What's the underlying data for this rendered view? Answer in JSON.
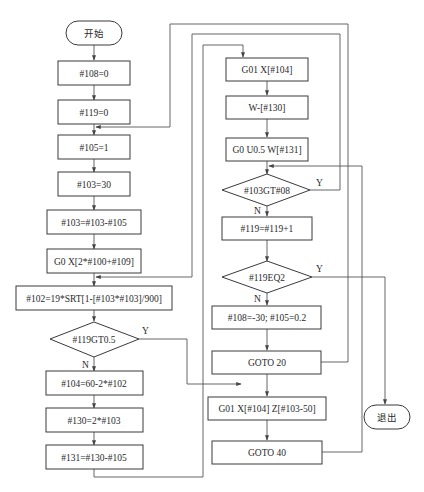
{
  "diagram": {
    "type": "flowchart",
    "title": "",
    "nodes": [
      {
        "id": "start",
        "shape": "terminal",
        "label": "开始"
      },
      {
        "id": "n1",
        "shape": "process",
        "label": "#108=0"
      },
      {
        "id": "n2",
        "shape": "process",
        "label": "#119=0"
      },
      {
        "id": "n3",
        "shape": "process",
        "label": "#105=1"
      },
      {
        "id": "n4",
        "shape": "process",
        "label": "#103=30"
      },
      {
        "id": "n5",
        "shape": "process",
        "label": "#103=#103-#105"
      },
      {
        "id": "n6",
        "shape": "process",
        "label": "G0 X[2*#100+#109]"
      },
      {
        "id": "n7",
        "shape": "process",
        "label": "#102=19*SRT[1-[#103*#103]/900]"
      },
      {
        "id": "d1",
        "shape": "decision",
        "label": "#119GT0.5"
      },
      {
        "id": "n8",
        "shape": "process",
        "label": "#104=60-2*#102"
      },
      {
        "id": "n9",
        "shape": "process",
        "label": "#130=2*#103"
      },
      {
        "id": "n10",
        "shape": "process",
        "label": "#131=#130-#105"
      },
      {
        "id": "r1",
        "shape": "process",
        "label": "G01 X[#104]"
      },
      {
        "id": "r2",
        "shape": "process",
        "label": "W-[#130]"
      },
      {
        "id": "r3",
        "shape": "process",
        "label": "G0 U0.5 W[#131]"
      },
      {
        "id": "d2",
        "shape": "decision",
        "label": "#103GT#08"
      },
      {
        "id": "r4",
        "shape": "process",
        "label": "#119=#119+1"
      },
      {
        "id": "d3",
        "shape": "decision",
        "label": "#119EQ2"
      },
      {
        "id": "r5",
        "shape": "process",
        "label": "#108=-30; #105=0.2"
      },
      {
        "id": "r6",
        "shape": "process",
        "label": "GOTO 20"
      },
      {
        "id": "r7",
        "shape": "process",
        "label": "G01 X[#104] Z[#103-50]"
      },
      {
        "id": "r8",
        "shape": "process",
        "label": "GOTO 40"
      },
      {
        "id": "exit",
        "shape": "terminal",
        "label": "退出"
      }
    ],
    "edges": [
      {
        "from": "start",
        "to": "n1",
        "label": ""
      },
      {
        "from": "n1",
        "to": "n2",
        "label": ""
      },
      {
        "from": "n2",
        "to": "n3",
        "label": ""
      },
      {
        "from": "n3",
        "to": "n4",
        "label": ""
      },
      {
        "from": "n4",
        "to": "n5",
        "label": ""
      },
      {
        "from": "n5",
        "to": "n6",
        "label": ""
      },
      {
        "from": "n6",
        "to": "n7",
        "label": ""
      },
      {
        "from": "n7",
        "to": "d1",
        "label": ""
      },
      {
        "from": "d1",
        "to": "n8",
        "label": "N"
      },
      {
        "from": "d1",
        "to": "r7",
        "label": "Y"
      },
      {
        "from": "n8",
        "to": "n9",
        "label": ""
      },
      {
        "from": "n9",
        "to": "n10",
        "label": ""
      },
      {
        "from": "n10",
        "to": "r1",
        "label": ""
      },
      {
        "from": "r1",
        "to": "r2",
        "label": ""
      },
      {
        "from": "r2",
        "to": "r3",
        "label": ""
      },
      {
        "from": "r3",
        "to": "d2",
        "label": ""
      },
      {
        "from": "d2",
        "to": "n6",
        "label": "Y"
      },
      {
        "from": "d2",
        "to": "r4",
        "label": "N"
      },
      {
        "from": "r4",
        "to": "d3",
        "label": ""
      },
      {
        "from": "d3",
        "to": "exit",
        "label": "Y"
      },
      {
        "from": "d3",
        "to": "r5",
        "label": "N"
      },
      {
        "from": "r5",
        "to": "r6",
        "label": ""
      },
      {
        "from": "r6",
        "to": "n3",
        "label": ""
      },
      {
        "from": "r7",
        "to": "r8",
        "label": ""
      },
      {
        "from": "r8",
        "to": "d2",
        "label": ""
      }
    ],
    "branch_labels": {
      "yes": "Y",
      "no": "N"
    }
  }
}
